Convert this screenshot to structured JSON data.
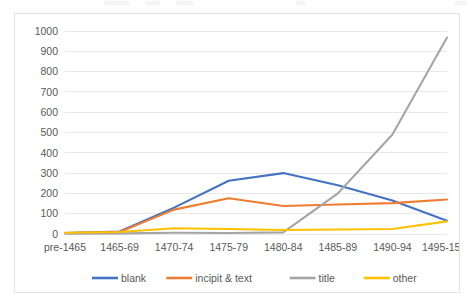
{
  "chart_data": {
    "type": "line",
    "title": "",
    "subtitle": "",
    "xlabel": "",
    "ylabel": "",
    "categories": [
      "pre-1465",
      "1465-69",
      "1470-74",
      "1475-79",
      "1480-84",
      "1485-89",
      "1490-94",
      "1495-1500"
    ],
    "series": [
      {
        "name": "blank",
        "color": "#4472C4",
        "values": [
          5,
          12,
          130,
          262,
          300,
          240,
          165,
          65
        ]
      },
      {
        "name": "incipit & text",
        "color": "#ED7D31",
        "values": [
          5,
          10,
          120,
          176,
          138,
          145,
          152,
          170
        ]
      },
      {
        "name": "title",
        "color": "#A5A5A5",
        "values": [
          2,
          3,
          6,
          5,
          8,
          200,
          490,
          968
        ]
      },
      {
        "name": "other",
        "color": "#FFC000",
        "values": [
          6,
          10,
          28,
          25,
          20,
          22,
          25,
          62
        ]
      }
    ],
    "ylim": [
      0,
      1000
    ],
    "yticks": [
      0,
      100,
      200,
      300,
      400,
      500,
      600,
      700,
      800,
      900,
      1000
    ],
    "ytick_labels": [
      "0",
      "100",
      "200",
      "300",
      "400",
      "500",
      "600",
      "700",
      "800",
      "900",
      "1000"
    ],
    "grid": true,
    "grid_axis": "y",
    "legend": {
      "position": "bottom",
      "entries": [
        "blank",
        "incipit & text",
        "title",
        "other"
      ]
    },
    "annotations": []
  },
  "chart_frame": {
    "border_color": "#e4e4e4",
    "background": "#ffffff"
  }
}
